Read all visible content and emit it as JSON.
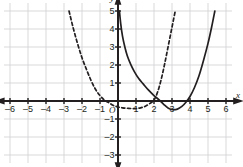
{
  "figure": {
    "name": "coordinate-plane-two-parabolas",
    "background": "#ffffff",
    "grid_color": "#d5d5d7",
    "axis_color": "#231f20",
    "curve_color": "#231f20",
    "origin_label": "O",
    "x_axis_label": "x",
    "y_axis_label": "y"
  },
  "chart_data": {
    "type": "line",
    "title": "",
    "xlabel": "x",
    "ylabel": "y",
    "xlim": [
      -6.6,
      6.6
    ],
    "ylim": [
      -3.6,
      5.6
    ],
    "grid": true,
    "grid_step": 1,
    "legend": "none",
    "x_ticks": [
      -6,
      -5,
      -4,
      -3,
      -2,
      -1,
      1,
      2,
      3,
      4,
      5,
      6
    ],
    "x_tick_labels": [
      "–6",
      "–5",
      "–4",
      "–3",
      "–2",
      "–1",
      "1",
      "2",
      "3",
      "4",
      "5",
      "6"
    ],
    "y_ticks": [
      -3,
      -2,
      -1,
      1,
      2,
      3,
      4,
      5
    ],
    "y_tick_labels": [
      "–3",
      "–2",
      "–1",
      "1",
      "2",
      "3",
      "4",
      "5"
    ],
    "series": [
      {
        "name": "dashed-parabola",
        "style": "dashed",
        "description": "upward parabola, vertex near (1, -0.4), x-intercepts near 0 and 2",
        "vertex": [
          1,
          -0.4
        ],
        "roots": [
          0.05,
          1.95
        ],
        "points": [
          [
            -2.72,
            5.0
          ],
          [
            -2.5,
            4.1
          ],
          [
            -2.25,
            3.2
          ],
          [
            -2.0,
            2.4
          ],
          [
            -1.75,
            1.75
          ],
          [
            -1.5,
            1.15
          ],
          [
            -1.25,
            0.65
          ],
          [
            -1.0,
            0.3
          ],
          [
            -0.75,
            0.05
          ],
          [
            -0.5,
            -0.1
          ],
          [
            -0.25,
            -0.25
          ],
          [
            0.0,
            -0.33
          ],
          [
            0.25,
            -0.38
          ],
          [
            0.5,
            -0.4
          ],
          [
            0.75,
            -0.42
          ],
          [
            1.0,
            -0.42
          ],
          [
            1.25,
            -0.38
          ],
          [
            1.5,
            -0.3
          ],
          [
            1.75,
            -0.15
          ],
          [
            2.0,
            0.05
          ],
          [
            2.2,
            0.5
          ],
          [
            2.4,
            1.2
          ],
          [
            2.6,
            2.1
          ],
          [
            2.8,
            3.1
          ],
          [
            3.0,
            4.1
          ],
          [
            3.18,
            5.0
          ]
        ]
      },
      {
        "name": "solid-parabola",
        "style": "solid",
        "description": "upward parabola, vertex near (3, -0.5), x-intercepts near 2 and 4",
        "vertex": [
          3,
          -0.5
        ],
        "roots": [
          2.05,
          3.95
        ],
        "points": [
          [
            0.08,
            5.0
          ],
          [
            0.15,
            4.3
          ],
          [
            0.25,
            3.6
          ],
          [
            0.38,
            3.0
          ],
          [
            0.52,
            2.5
          ],
          [
            0.7,
            2.05
          ],
          [
            0.9,
            1.65
          ],
          [
            1.15,
            1.25
          ],
          [
            1.4,
            0.95
          ],
          [
            1.7,
            0.6
          ],
          [
            2.0,
            0.3
          ],
          [
            2.3,
            0.05
          ],
          [
            2.55,
            -0.2
          ],
          [
            2.8,
            -0.4
          ],
          [
            3.05,
            -0.48
          ],
          [
            3.3,
            -0.45
          ],
          [
            3.55,
            -0.3
          ],
          [
            3.75,
            -0.1
          ],
          [
            4.0,
            0.25
          ],
          [
            4.25,
            0.75
          ],
          [
            4.5,
            1.4
          ],
          [
            4.75,
            2.25
          ],
          [
            5.0,
            3.2
          ],
          [
            5.2,
            4.1
          ],
          [
            5.38,
            5.0
          ]
        ]
      }
    ]
  }
}
